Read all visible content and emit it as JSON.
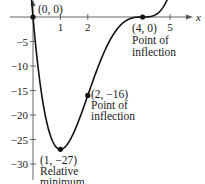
{
  "chart_data": {
    "type": "line",
    "title": "",
    "xlabel": "x",
    "ylabel": "",
    "function": "f(x) = x(x - 4)^3",
    "xlim": [
      0,
      5.5
    ],
    "ylim": [
      -33,
      3
    ],
    "grid": false,
    "x_ticks": [
      1,
      2,
      5
    ],
    "x_tick_labels": [
      "1",
      "2",
      "5"
    ],
    "y_ticks": [
      -5,
      -10,
      -15,
      -20,
      -25,
      -30
    ],
    "y_tick_labels": [
      "-5",
      "-10",
      "-15",
      "-20",
      "-25",
      "-30"
    ],
    "series": [
      {
        "name": "f(x)",
        "x": [
          -0.06,
          0,
          0.25,
          0.5,
          0.75,
          1,
          1.25,
          1.5,
          1.75,
          2,
          2.25,
          2.5,
          2.75,
          3,
          3.25,
          3.5,
          3.75,
          4,
          4.25,
          4.5,
          4.75,
          4.95
        ],
        "y": [
          3.95,
          0,
          -10.55,
          -21.44,
          -26.48,
          -27,
          -25.99,
          -23.44,
          -19.93,
          -16,
          -12.06,
          -8.44,
          -5.37,
          -3,
          -1.37,
          -0.44,
          -0.06,
          0,
          0.07,
          0.56,
          2.0,
          4.29
        ]
      }
    ],
    "points": [
      {
        "x": 0,
        "y": 0,
        "label": "(0, 0)",
        "note": ""
      },
      {
        "x": 1,
        "y": -27,
        "label": "(1, −27)",
        "note": "Relative minimum"
      },
      {
        "x": 2,
        "y": -16,
        "label": "(2, −16)",
        "note": "Point of inflection"
      },
      {
        "x": 4,
        "y": 0,
        "label": "(4, 0)",
        "note": "Point of inflection"
      }
    ],
    "annotations": {
      "p0": [
        "(0, 0)"
      ],
      "p1": [
        "(1, −27)",
        "Relative",
        "minimum"
      ],
      "p2": [
        "(2, −16)",
        "Point of",
        "inflection"
      ],
      "p4": [
        "(4, 0)",
        "Point of",
        "inflection"
      ]
    }
  }
}
